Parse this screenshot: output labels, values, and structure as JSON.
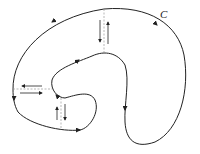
{
  "diagram": {
    "curve_label": "C",
    "colors": {
      "stroke": "#222222",
      "cut": "#999999",
      "background": "#ffffff"
    },
    "cuts": [
      {
        "name": "top-cut",
        "arrows": [
          "down",
          "up"
        ]
      },
      {
        "name": "left-cut",
        "arrows": [
          "left",
          "right"
        ]
      },
      {
        "name": "bottom-cut",
        "arrows": [
          "up",
          "down"
        ]
      }
    ]
  }
}
